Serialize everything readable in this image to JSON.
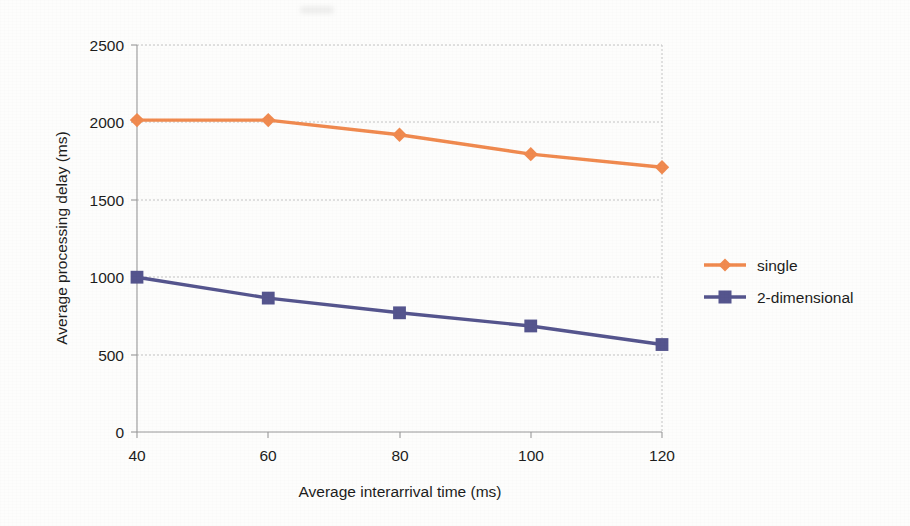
{
  "chart_data": {
    "type": "line",
    "title": "",
    "xlabel": "Average interarrival time (ms)",
    "ylabel": "Average processing delay (ms)",
    "x": [
      40,
      60,
      80,
      100,
      120
    ],
    "xticks": [
      "40",
      "60",
      "80",
      "100",
      "120"
    ],
    "yticks": [
      "0",
      "500",
      "1000",
      "1500",
      "2000",
      "2500"
    ],
    "xlim": [
      40,
      120
    ],
    "ylim": [
      0,
      2500
    ],
    "grid": "horizontal-dotted",
    "legend_position": "right",
    "series": [
      {
        "name": "single",
        "color": "#F08A4F",
        "marker": "diamond",
        "values": [
          2015,
          2015,
          1920,
          1795,
          1710
        ]
      },
      {
        "name": "2-dimensional",
        "color": "#55558E",
        "marker": "square",
        "values": [
          1000,
          865,
          770,
          685,
          565
        ]
      }
    ]
  },
  "legend": {
    "items": [
      {
        "label": "single",
        "color": "#F08A4F",
        "marker": "diamond"
      },
      {
        "label": "2-dimensional",
        "color": "#55558E",
        "marker": "square"
      }
    ]
  },
  "axes": {
    "x_title": "Average interarrival time (ms)",
    "y_title": "Average processing delay (ms)",
    "x_tick_0": "40",
    "x_tick_1": "60",
    "x_tick_2": "80",
    "x_tick_3": "100",
    "x_tick_4": "120",
    "y_tick_0": "0",
    "y_tick_1": "500",
    "y_tick_2": "1000",
    "y_tick_3": "1500",
    "y_tick_4": "2000",
    "y_tick_5": "2500"
  },
  "colors": {
    "series_single": "#F08A4F",
    "series_two_dimensional": "#55558E",
    "axis": "#9a9a9a",
    "grid": "#c8c8c8",
    "text": "#1d1d1d",
    "background": "#fdfdfc"
  }
}
